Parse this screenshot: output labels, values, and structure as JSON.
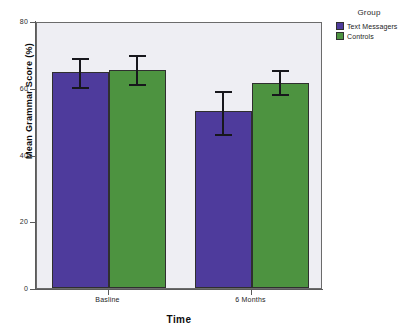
{
  "chart_data": {
    "type": "bar",
    "title": "",
    "xlabel": "Time",
    "ylabel": "Mean Grammar Score (%)",
    "categories": [
      "Basline",
      "6 Months"
    ],
    "ylim": [
      0,
      80
    ],
    "yticks": [
      0,
      20,
      40,
      60,
      80
    ],
    "ytick_labels": [
      "0",
      "20",
      "40",
      "60",
      "80"
    ],
    "grid": false,
    "legend_position": "right",
    "legend_title": "Group",
    "error_bars": "95% CI",
    "series": [
      {
        "name": "Text Messagers",
        "color": "#4e3b9c",
        "values": [
          64.7,
          53.0
        ],
        "error_low": [
          60.2,
          46.1
        ],
        "error_high": [
          69.5,
          59.7
        ]
      },
      {
        "name": "Controls",
        "color": "#4d9340",
        "values": [
          65.4,
          61.5
        ],
        "error_low": [
          61.2,
          58.0
        ],
        "error_high": [
          70.3,
          65.8
        ]
      }
    ]
  },
  "legend": {
    "title": "Group",
    "items": [
      {
        "label": "Text Messagers",
        "color": "#4e3b9c"
      },
      {
        "label": "Controls",
        "color": "#4d9340"
      }
    ]
  },
  "axes": {
    "y_title": "Mean Grammar Score (%)",
    "x_title": "Time",
    "y_labels": [
      "80",
      "60",
      "40",
      "20",
      "0"
    ],
    "x_labels": [
      "Basline",
      "6 Months"
    ]
  }
}
